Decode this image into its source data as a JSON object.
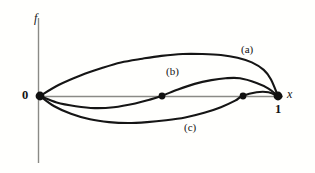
{
  "figure": {
    "background_color": "#fffffd",
    "curve_color": "#151515",
    "axis_color": "#8a8a86"
  },
  "axes": {
    "y_axis_label": "f",
    "x_axis_label": "x",
    "origin_label": "0",
    "right_tick_label": "1"
  },
  "curve_labels": {
    "a": "(a)",
    "b": "(b)",
    "c": "(c)"
  },
  "chart_data": {
    "type": "line",
    "xlabel": "x",
    "ylabel": "f",
    "xlim": [
      0,
      1
    ],
    "ylim": [
      -0.45,
      0.62
    ],
    "grid": false,
    "legend": "inline-annotations",
    "xticks": [
      0,
      1
    ],
    "xticklabels": [
      "0",
      "1"
    ],
    "yticks": [
      0
    ],
    "yticklabels": [
      "0"
    ],
    "annotations": [
      {
        "text": "(a)",
        "x": 0.84,
        "y": 0.43
      },
      {
        "text": "(b)",
        "x": 0.53,
        "y": 0.29
      },
      {
        "text": "(c)",
        "x": 0.61,
        "y": -0.27
      }
    ],
    "marked_points": [
      {
        "x": 0.0,
        "y": 0.0,
        "label": "0"
      },
      {
        "x": 0.513,
        "y": 0.0,
        "label": ""
      },
      {
        "x": 0.853,
        "y": 0.0,
        "label": ""
      },
      {
        "x": 1.0,
        "y": 0.0,
        "label": "1"
      }
    ],
    "series": [
      {
        "name": "(a)",
        "x": [
          0.0,
          0.08,
          0.17,
          0.26,
          0.34,
          0.43,
          0.51,
          0.6,
          0.68,
          0.76,
          0.83,
          0.89,
          0.94,
          0.97,
          1.0
        ],
        "values": [
          0.0,
          0.12,
          0.22,
          0.3,
          0.36,
          0.4,
          0.43,
          0.45,
          0.45,
          0.44,
          0.41,
          0.36,
          0.28,
          0.18,
          0.0
        ]
      },
      {
        "name": "(b)",
        "x": [
          0.0,
          0.07,
          0.15,
          0.23,
          0.31,
          0.4,
          0.46,
          0.51,
          0.58,
          0.65,
          0.72,
          0.78,
          0.84,
          0.91,
          0.96,
          1.0
        ],
        "values": [
          0.0,
          -0.07,
          -0.11,
          -0.13,
          -0.12,
          -0.08,
          -0.04,
          0.0,
          0.07,
          0.13,
          0.17,
          0.19,
          0.19,
          0.14,
          0.08,
          0.0
        ]
      },
      {
        "name": "(c)",
        "x": [
          0.0,
          0.06,
          0.13,
          0.21,
          0.29,
          0.37,
          0.45,
          0.53,
          0.61,
          0.69,
          0.76,
          0.82,
          0.85,
          0.91,
          0.96,
          1.0
        ],
        "values": [
          0.0,
          -0.11,
          -0.19,
          -0.25,
          -0.28,
          -0.29,
          -0.28,
          -0.26,
          -0.23,
          -0.18,
          -0.12,
          -0.05,
          0.0,
          0.04,
          0.04,
          0.0
        ]
      }
    ]
  }
}
